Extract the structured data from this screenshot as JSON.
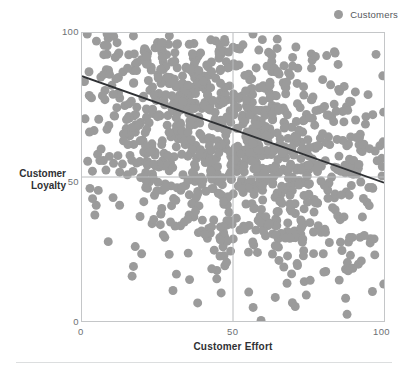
{
  "legend": {
    "position": "top-right",
    "entries": [
      {
        "label": "Customers",
        "color": "#9b9b9b",
        "marker": "circle"
      }
    ]
  },
  "axes": {
    "x": {
      "title": "Customer Effort",
      "ticks": [
        "0",
        "50",
        "100"
      ],
      "min": 0,
      "max": 100
    },
    "y": {
      "title_line1": "Customer",
      "title_line2": "Loyalty",
      "ticks": [
        "100",
        "50",
        "0"
      ],
      "min": 0,
      "max": 100
    }
  },
  "colors": {
    "marker": "#9b9b9b",
    "trendline": "#2f3134",
    "axis": "#c4c6c8",
    "quadrant": "#b9bbbd",
    "tick_text": "#6d7073",
    "title_text": "#2f3134",
    "background": "#ffffff"
  },
  "chart_data": {
    "type": "scatter",
    "title": "",
    "xlabel": "Customer Effort",
    "ylabel": "Customer Loyalty",
    "xlim": [
      0,
      100
    ],
    "ylim": [
      0,
      100
    ],
    "grid": false,
    "quadrant_lines": {
      "x": 50,
      "y": 50
    },
    "legend_position": "top-right",
    "series": [
      {
        "name": "Customers",
        "color": "#9b9b9b",
        "marker_size": 9,
        "n_points": 1100,
        "description": "Dense cloud of customer observations; density highest in the upper-left quadrant (low effort, high loyalty) and thinning toward the lower-right (high effort, low loyalty).",
        "density_by_quadrant": {
          "upper_left": 430,
          "upper_right": 300,
          "lower_left": 170,
          "lower_right": 200
        },
        "generation": {
          "method": "correlated-normal",
          "correlation": -0.33,
          "x_mean": 50,
          "x_sd": 27,
          "y_mean": 62,
          "y_sd": 24
        }
      }
    ],
    "trendline": {
      "name": "linear fit",
      "color": "#2f3134",
      "width": 1.8,
      "x_points": [
        0,
        100
      ],
      "y_points": [
        85,
        48
      ],
      "slope": -0.37,
      "intercept": 85
    }
  }
}
